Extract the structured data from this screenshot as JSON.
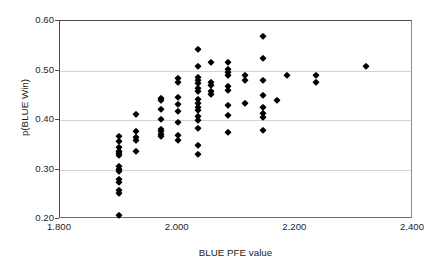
{
  "chart_data": {
    "type": "scatter",
    "title": "",
    "xlabel": "BLUE PFE value",
    "ylabel": "p(BLUE Win)",
    "xlim": [
      1.8,
      2.4
    ],
    "ylim": [
      0.2,
      0.6
    ],
    "xticks": [
      "1.800",
      "2.000",
      "2.200",
      "2.400"
    ],
    "xtick_values": [
      1.8,
      2.0,
      2.2,
      2.4
    ],
    "yticks": [
      "0.20",
      "0.30",
      "0.40",
      "0.50",
      "0.60"
    ],
    "ytick_values": [
      0.2,
      0.3,
      0.4,
      0.5,
      0.6
    ],
    "grid": "horizontal",
    "legend": null,
    "marker": "diamond",
    "marker_color": "#000000",
    "series": [
      {
        "name": "BLUE PFE vs p(BLUE Win)",
        "points": [
          [
            1.9,
            0.368
          ],
          [
            1.9,
            0.358
          ],
          [
            1.9,
            0.345
          ],
          [
            1.9,
            0.338
          ],
          [
            1.9,
            0.333
          ],
          [
            1.9,
            0.329
          ],
          [
            1.9,
            0.307
          ],
          [
            1.9,
            0.301
          ],
          [
            1.9,
            0.297
          ],
          [
            1.9,
            0.28
          ],
          [
            1.9,
            0.275
          ],
          [
            1.9,
            0.258
          ],
          [
            1.9,
            0.252
          ],
          [
            1.9,
            0.208
          ],
          [
            1.93,
            0.377
          ],
          [
            1.93,
            0.365
          ],
          [
            1.93,
            0.359
          ],
          [
            1.93,
            0.337
          ],
          [
            1.93,
            0.412
          ],
          [
            1.972,
            0.445
          ],
          [
            1.972,
            0.44
          ],
          [
            1.972,
            0.422
          ],
          [
            1.972,
            0.402
          ],
          [
            1.972,
            0.382
          ],
          [
            1.972,
            0.377
          ],
          [
            1.972,
            0.372
          ],
          [
            1.972,
            0.367
          ],
          [
            2.0,
            0.484
          ],
          [
            2.0,
            0.476
          ],
          [
            2.0,
            0.447
          ],
          [
            2.0,
            0.432
          ],
          [
            2.0,
            0.418
          ],
          [
            2.0,
            0.395
          ],
          [
            2.0,
            0.369
          ],
          [
            2.0,
            0.359
          ],
          [
            2.035,
            0.543
          ],
          [
            2.035,
            0.509
          ],
          [
            2.035,
            0.487
          ],
          [
            2.035,
            0.481
          ],
          [
            2.035,
            0.474
          ],
          [
            2.035,
            0.465
          ],
          [
            2.035,
            0.459
          ],
          [
            2.035,
            0.443
          ],
          [
            2.035,
            0.435
          ],
          [
            2.035,
            0.427
          ],
          [
            2.035,
            0.421
          ],
          [
            2.035,
            0.408
          ],
          [
            2.035,
            0.4
          ],
          [
            2.035,
            0.384
          ],
          [
            2.035,
            0.35
          ],
          [
            2.035,
            0.331
          ],
          [
            2.057,
            0.517
          ],
          [
            2.057,
            0.477
          ],
          [
            2.057,
            0.47
          ],
          [
            2.057,
            0.458
          ],
          [
            2.057,
            0.452
          ],
          [
            2.086,
            0.518
          ],
          [
            2.086,
            0.503
          ],
          [
            2.086,
            0.497
          ],
          [
            2.086,
            0.49
          ],
          [
            2.086,
            0.469
          ],
          [
            2.086,
            0.461
          ],
          [
            2.086,
            0.43
          ],
          [
            2.086,
            0.411
          ],
          [
            2.086,
            0.375
          ],
          [
            2.115,
            0.491
          ],
          [
            2.115,
            0.48
          ],
          [
            2.115,
            0.435
          ],
          [
            2.145,
            0.57
          ],
          [
            2.145,
            0.525
          ],
          [
            2.145,
            0.481
          ],
          [
            2.145,
            0.45
          ],
          [
            2.145,
            0.427
          ],
          [
            2.145,
            0.414
          ],
          [
            2.145,
            0.406
          ],
          [
            2.145,
            0.379
          ],
          [
            2.168,
            0.44
          ],
          [
            2.185,
            0.491
          ],
          [
            2.235,
            0.49
          ],
          [
            2.235,
            0.476
          ],
          [
            2.32,
            0.51
          ]
        ]
      }
    ]
  }
}
